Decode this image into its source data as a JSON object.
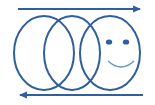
{
  "figure": {
    "colors": {
      "stroke": "#2f5f9e",
      "smile": "#6a93c8",
      "background": "#ffffff"
    },
    "arrows": [
      {
        "name": "top-arrow",
        "direction": "right",
        "x1": 18,
        "x2": 140,
        "y": 9
      },
      {
        "name": "bottom-arrow",
        "direction": "left",
        "x1": 20,
        "x2": 143,
        "y": 95
      }
    ],
    "ellipses": [
      {
        "name": "left-ellipse",
        "cx": 44,
        "cy": 53,
        "rx": 30,
        "ry": 37
      },
      {
        "name": "middle-ellipse",
        "cx": 72,
        "cy": 53,
        "rx": 28,
        "ry": 37
      },
      {
        "name": "right-ellipse",
        "cx": 110,
        "cy": 53,
        "rx": 30,
        "ry": 37
      }
    ],
    "face": {
      "eyes": [
        {
          "cx": 109,
          "cy": 42,
          "rx": 3.2,
          "ry": 2.6
        },
        {
          "cx": 126,
          "cy": 42,
          "rx": 3.2,
          "ry": 2.6
        }
      ],
      "smile": {
        "x1": 108,
        "y1": 61,
        "x2": 134,
        "y2": 61,
        "depth": 6
      }
    }
  }
}
